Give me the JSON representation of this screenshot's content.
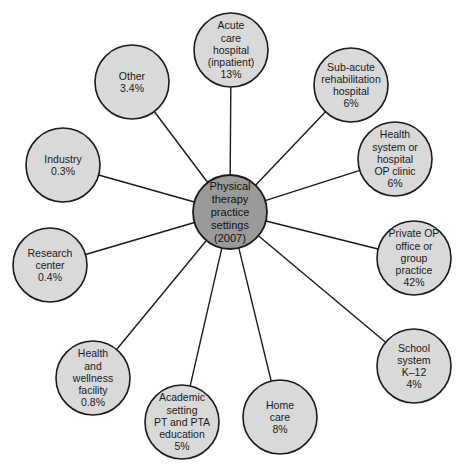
{
  "hub": {
    "label_lines": [
      "Physical",
      "therapy",
      "practice",
      "settings",
      "(2007)"
    ]
  },
  "nodes": [
    {
      "id": "acute-care-hospital",
      "label_lines": [
        "Acute",
        "care",
        "hospital",
        "(inpatient)",
        "13%"
      ],
      "percent": 13
    },
    {
      "id": "sub-acute-rehabilitation-hospital",
      "label_lines": [
        "Sub-acute",
        "rehabilitation",
        "hospital",
        "6%"
      ],
      "percent": 6
    },
    {
      "id": "health-system-op-clinic",
      "label_lines": [
        "Health",
        "system or",
        "hospital",
        "OP clinic",
        "6%"
      ],
      "percent": 6
    },
    {
      "id": "private-op-office",
      "label_lines": [
        "Private OP",
        "office or",
        "group",
        "practice",
        "42%"
      ],
      "percent": 42
    },
    {
      "id": "school-system",
      "label_lines": [
        "School",
        "system",
        "K–12",
        "4%"
      ],
      "percent": 4
    },
    {
      "id": "home-care",
      "label_lines": [
        "Home",
        "care",
        "8%"
      ],
      "percent": 8
    },
    {
      "id": "academic-setting",
      "label_lines": [
        "Academic",
        "setting",
        "PT and PTA",
        "education",
        "5%"
      ],
      "percent": 5
    },
    {
      "id": "health-wellness-facility",
      "label_lines": [
        "Health",
        "and",
        "wellness",
        "facility",
        "0.8%"
      ],
      "percent": 0.8
    },
    {
      "id": "research-center",
      "label_lines": [
        "Research",
        "center",
        "0.4%"
      ],
      "percent": 0.4
    },
    {
      "id": "industry",
      "label_lines": [
        "Industry",
        "0.3%"
      ],
      "percent": 0.3
    },
    {
      "id": "other",
      "label_lines": [
        "Other",
        "3.4%"
      ],
      "percent": 3.4
    }
  ]
}
